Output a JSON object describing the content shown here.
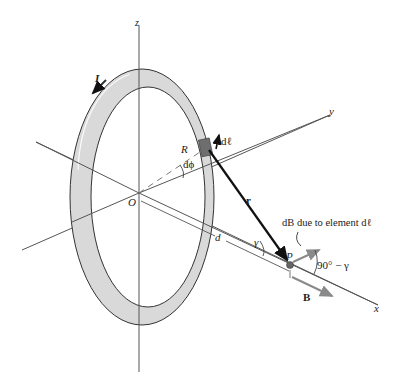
{
  "diagram": {
    "type": "physics-figure",
    "labels": {
      "z_axis": "z",
      "y_axis": "y",
      "x_axis": "x",
      "current": "I",
      "origin": "O",
      "radius": "R",
      "dphi": "dϕ",
      "dl": "dℓ",
      "r_vector": "r",
      "distance": "d",
      "gamma": "γ",
      "point": "P",
      "db_note": "dB due to element dℓ",
      "angle": "90° − γ",
      "b_field": "B"
    },
    "colors": {
      "ring_fill": "#d9d9d9",
      "ring_stroke": "#333333",
      "axis": "#444444",
      "vector": "#111111",
      "field_arrow": "#8a8a8a",
      "element": "#6e6e6e"
    }
  }
}
